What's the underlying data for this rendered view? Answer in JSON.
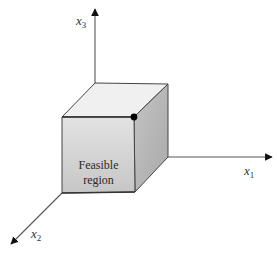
{
  "diagram": {
    "type": "3d-axes-with-cube",
    "axes": [
      {
        "id": "x1",
        "base": "x",
        "subscript": "1",
        "direction": "right"
      },
      {
        "id": "x2",
        "base": "x",
        "subscript": "2",
        "direction": "down-left"
      },
      {
        "id": "x3",
        "base": "x",
        "subscript": "3",
        "direction": "up"
      }
    ],
    "region": {
      "line1": "Feasible",
      "line2": "region"
    },
    "highlighted_vertex": "front-top-right corner of cube",
    "colors": {
      "front_face": "#cfcfcf",
      "top_face": "#efefef",
      "side_face": "#b0b0b0",
      "edge": "#444444",
      "axis": "#555555",
      "vertex_dot": "#000000"
    }
  }
}
